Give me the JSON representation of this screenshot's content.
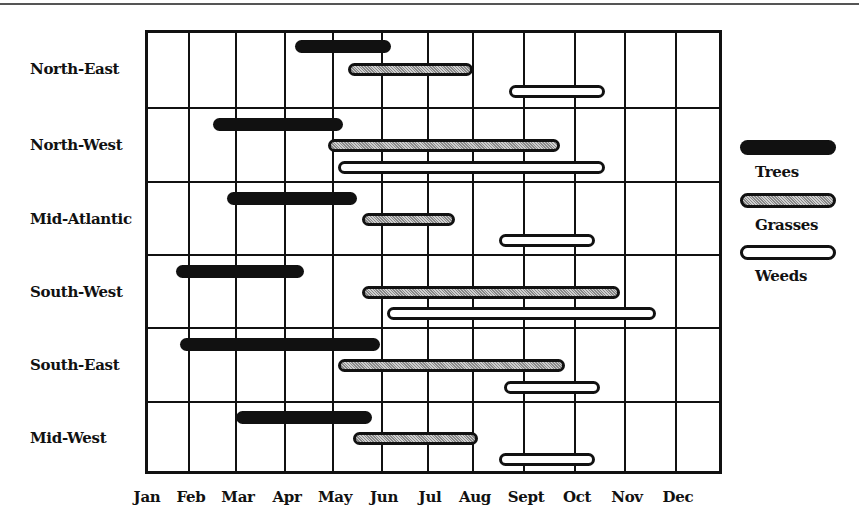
{
  "chart_data": {
    "type": "gantt",
    "title": "",
    "xlabel": "",
    "ylabel": "",
    "months": [
      "Jan",
      "Feb",
      "Mar",
      "Apr",
      "May",
      "Jun",
      "Jul",
      "Aug",
      "Sept",
      "Oct",
      "Nov",
      "Dec"
    ],
    "x_range_months": [
      0,
      12
    ],
    "grid": true,
    "legend_position": "right",
    "series_names": [
      "Trees",
      "Grasses",
      "Weeds"
    ],
    "regions": [
      {
        "name": "North-East",
        "bars": {
          "Trees": {
            "start": 3.2,
            "end": 5.2
          },
          "Grasses": {
            "start": 4.3,
            "end": 7.0
          },
          "Weeds": {
            "start": 7.7,
            "end": 9.6
          }
        }
      },
      {
        "name": "North-West",
        "bars": {
          "Trees": {
            "start": 1.5,
            "end": 4.2
          },
          "Grasses": {
            "start": 3.9,
            "end": 8.7
          },
          "Weeds": {
            "start": 4.1,
            "end": 9.6
          }
        }
      },
      {
        "name": "Mid-Atlantic",
        "bars": {
          "Trees": {
            "start": 1.8,
            "end": 4.5
          },
          "Grasses": {
            "start": 4.6,
            "end": 6.6
          },
          "Weeds": {
            "start": 7.5,
            "end": 9.4
          }
        }
      },
      {
        "name": "South-West",
        "bars": {
          "Trees": {
            "start": 0.7,
            "end": 3.4
          },
          "Grasses": {
            "start": 4.6,
            "end": 9.9
          },
          "Weeds": {
            "start": 5.1,
            "end": 10.6
          }
        }
      },
      {
        "name": "South-East",
        "bars": {
          "Trees": {
            "start": 0.8,
            "end": 4.95
          },
          "Grasses": {
            "start": 4.1,
            "end": 8.8
          },
          "Weeds": {
            "start": 7.6,
            "end": 9.5
          }
        }
      },
      {
        "name": "Mid-West",
        "bars": {
          "Trees": {
            "start": 2.0,
            "end": 4.8
          },
          "Grasses": {
            "start": 4.4,
            "end": 7.1
          },
          "Weeds": {
            "start": 7.5,
            "end": 9.4
          }
        }
      }
    ]
  },
  "legend": {
    "trees": "Trees",
    "grasses": "Grasses",
    "weeds": "Weeds"
  },
  "colors": {
    "trees": "#111111",
    "grasses": "#aaaaaa",
    "weeds": "#ffffff",
    "grid": "#111111"
  }
}
